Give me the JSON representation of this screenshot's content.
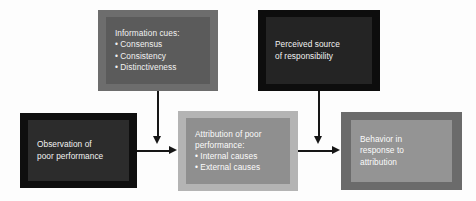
{
  "diagram": {
    "background_color": "#fdfdfd",
    "boxes": [
      {
        "id": "information-cues",
        "frame_color": "#6d6d6d",
        "fill_color": "#5b5b5b",
        "text_color": "#f2f2f2",
        "lines": [
          "Information cues:",
          "• Consensus",
          "• Consistency",
          "• Distinctiveness"
        ]
      },
      {
        "id": "perceived-source",
        "frame_color": "#0d0d0d",
        "fill_color": "#242424",
        "text_color": "#f2f2f2",
        "lines": [
          "Perceived source",
          "of responsibility"
        ]
      },
      {
        "id": "observation",
        "frame_color": "#0f0f0f",
        "fill_color": "#2c2c2c",
        "text_color": "#f2f2f2",
        "lines": [
          "Observation of",
          "poor performance"
        ]
      },
      {
        "id": "attribution",
        "frame_color": "#b4b4b4",
        "fill_color": "#8f8f8f",
        "text_color": "#fbfbfb",
        "lines": [
          "Attribution of poor",
          "performance:",
          "• Internal causes",
          "• External causes"
        ]
      },
      {
        "id": "behavior",
        "frame_color": "#6b6b6b",
        "fill_color": "#949494",
        "text_color": "#fbfbfb",
        "lines": [
          "Behavior in",
          "response to",
          "attribution"
        ]
      }
    ],
    "connectors": [
      {
        "id": "information-cues-to-attribution",
        "direction": "down",
        "color": "#161616"
      },
      {
        "id": "perceived-source-to-behavior",
        "direction": "down",
        "color": "#161616"
      },
      {
        "id": "observation-to-attribution",
        "direction": "right",
        "color": "#161616"
      },
      {
        "id": "attribution-to-behavior",
        "direction": "right",
        "color": "#161616"
      }
    ]
  }
}
